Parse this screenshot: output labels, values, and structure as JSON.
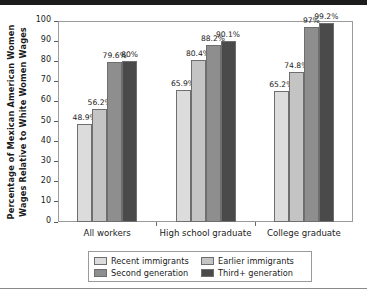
{
  "chart_data": {
    "type": "bar",
    "title": "",
    "xlabel": "",
    "ylabel": "Percentage of Mexican American Women Wages Relative to White Women Wages",
    "ylabel_line1": "Percentage of Mexican American Women",
    "ylabel_line2": "Wages Relative to White Women Wages",
    "ylim": [
      0,
      100
    ],
    "ytick_labels": [
      "0",
      "10",
      "20",
      "30",
      "40",
      "50",
      "60",
      "70",
      "80",
      "90",
      "100"
    ],
    "ytick_values": [
      0,
      10,
      20,
      30,
      40,
      50,
      60,
      70,
      80,
      90,
      100
    ],
    "grid": false,
    "legend_position": "bottom",
    "categories": [
      "All workers",
      "High school graduate",
      "College graduate"
    ],
    "series": [
      {
        "name": "Recent immigrants",
        "color": "#dcdcdc",
        "values": [
          48.9,
          65.9,
          65.2
        ],
        "labels": [
          "48.9%",
          "65.9%",
          "65.2%"
        ]
      },
      {
        "name": "Earlier immigrants",
        "color": "#c4c4c4",
        "values": [
          56.2,
          80.4,
          74.8
        ],
        "labels": [
          "56.2%",
          "80.4%",
          "74.8%"
        ]
      },
      {
        "name": "Second generation",
        "color": "#8e8e8e",
        "values": [
          79.6,
          88.2,
          97.0
        ],
        "labels": [
          "79.6%",
          "88.2%",
          "97%"
        ]
      },
      {
        "name": "Third+ generation",
        "color": "#4a4a4a",
        "values": [
          80.0,
          90.1,
          99.2
        ],
        "labels": [
          "80%",
          "90.1%",
          "99.2%"
        ]
      }
    ]
  },
  "legend": {
    "items": [
      {
        "label": "Recent immigrants",
        "color": "#dcdcdc"
      },
      {
        "label": "Earlier immigrants",
        "color": "#c4c4c4"
      },
      {
        "label": "Second generation",
        "color": "#8e8e8e"
      },
      {
        "label": "Third+ generation",
        "color": "#4a4a4a"
      }
    ]
  }
}
